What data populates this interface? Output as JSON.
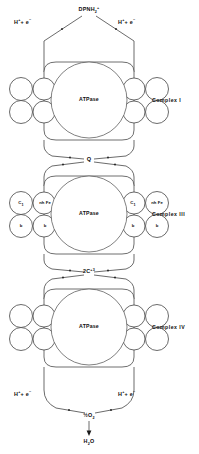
{
  "diagram": {
    "type": "schematic-diagram",
    "background_color": "#ffffff",
    "line_color": "#2b2b2b"
  },
  "top": {
    "substrate_label": "DPNH",
    "substrate_sub": "2",
    "substrate_sup": "+",
    "left_donor": "H",
    "left_donor_sup": "+",
    "left_donor_plus": "+ e",
    "left_donor_sup2": "−",
    "right_donor": "H",
    "right_donor_sup": "+",
    "right_donor_plus": "+ e",
    "right_donor_sup2": "−"
  },
  "carriers": {
    "q_label": "Q",
    "cytochrome_c_label": "2C",
    "cytochrome_c_sup": "+3",
    "oxygen_label": "½O",
    "oxygen_sub": "2",
    "water_label": "H",
    "water_sub": "2",
    "water_tail": "O"
  },
  "bottom": {
    "left_donor": "H",
    "left_donor_sup": "+",
    "left_donor_plus": "+ e",
    "left_donor_sup2": "−",
    "right_donor": "H",
    "right_donor_sup": "+",
    "right_donor_plus": "+ e",
    "right_donor_sup2": "−"
  },
  "complexes": [
    {
      "id": "complex-1",
      "label": "Complex  I",
      "core_label": "ATPase",
      "subunits": [
        {
          "position": "outer-left-top",
          "label": ""
        },
        {
          "position": "outer-left-bottom",
          "label": ""
        },
        {
          "position": "inner-left-top",
          "label": ""
        },
        {
          "position": "inner-left-bottom",
          "label": ""
        },
        {
          "position": "inner-right-top",
          "label": ""
        },
        {
          "position": "inner-right-bottom",
          "label": ""
        },
        {
          "position": "outer-right-top",
          "label": ""
        },
        {
          "position": "outer-right-bottom",
          "label": ""
        }
      ]
    },
    {
      "id": "complex-3",
      "label": "Complex  III",
      "core_label": "ATPase",
      "subunits": [
        {
          "position": "outer-left-top",
          "label": "C",
          "sub": "1"
        },
        {
          "position": "outer-left-bottom",
          "label": "b",
          "sub": ""
        },
        {
          "position": "inner-left-top",
          "label": "nh Fe",
          "sub": ""
        },
        {
          "position": "inner-left-bottom",
          "label": "b",
          "sub": ""
        },
        {
          "position": "inner-right-top",
          "label": "C",
          "sub": "1"
        },
        {
          "position": "inner-right-bottom",
          "label": "b",
          "sub": ""
        },
        {
          "position": "outer-right-top",
          "label": "nh Fe",
          "sub": ""
        },
        {
          "position": "outer-right-bottom",
          "label": "b",
          "sub": ""
        }
      ]
    },
    {
      "id": "complex-4",
      "label": "Complex  IV",
      "core_label": "ATPase",
      "subunits": [
        {
          "position": "outer-left-top",
          "label": ""
        },
        {
          "position": "outer-left-bottom",
          "label": ""
        },
        {
          "position": "inner-left-top",
          "label": ""
        },
        {
          "position": "inner-left-bottom",
          "label": ""
        },
        {
          "position": "inner-right-top",
          "label": ""
        },
        {
          "position": "inner-right-bottom",
          "label": ""
        },
        {
          "position": "outer-right-top",
          "label": ""
        },
        {
          "position": "outer-right-bottom",
          "label": ""
        }
      ]
    }
  ]
}
